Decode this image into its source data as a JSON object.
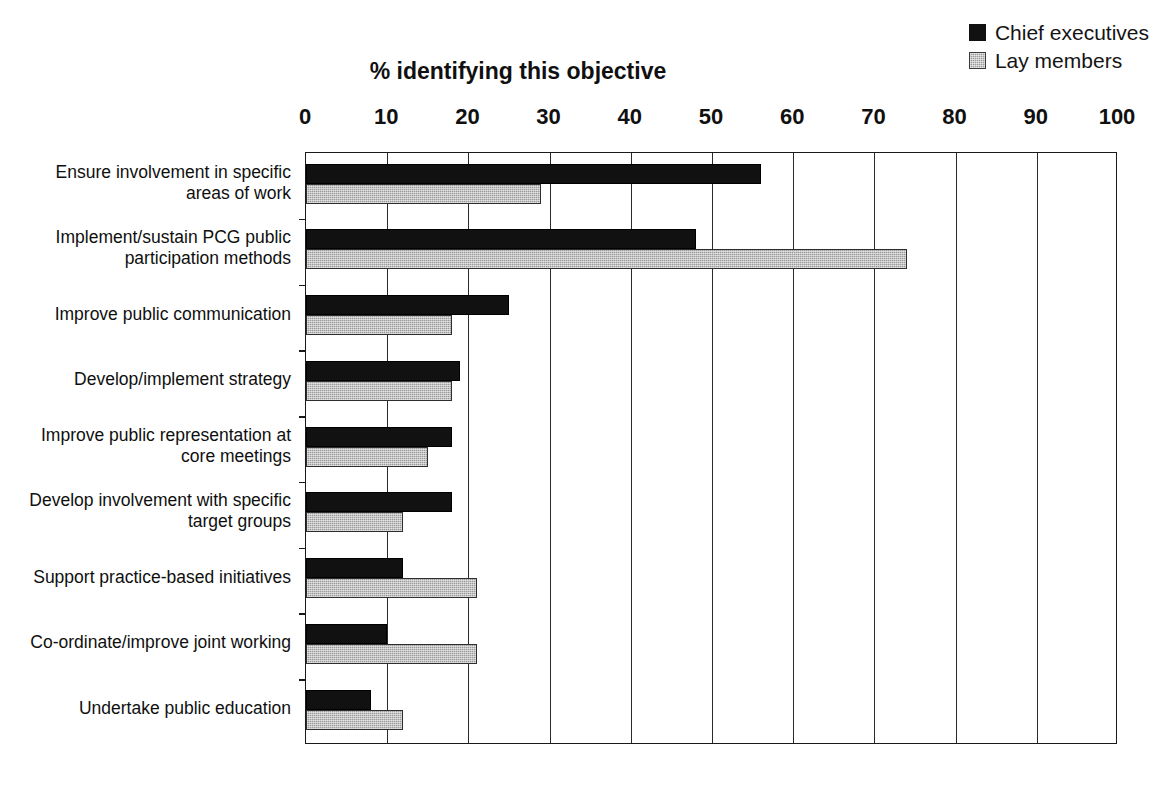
{
  "figure": {
    "cut_off_caption": "",
    "axis_title": "% identifying this objective"
  },
  "legend": {
    "entries": [
      {
        "label": "Chief executives",
        "color": "#111111",
        "swatch": "black"
      },
      {
        "label": "Lay members",
        "color": "#9b9b9b",
        "swatch": "gray"
      }
    ]
  },
  "chart_data": {
    "type": "bar",
    "orientation": "horizontal",
    "title": "",
    "xlabel": "% identifying this objective",
    "ylabel": "",
    "xlim": [
      0,
      100
    ],
    "xticks": [
      0,
      10,
      20,
      30,
      40,
      50,
      60,
      70,
      80,
      90,
      100
    ],
    "xtick_labels": [
      "0",
      "10",
      "20",
      "30",
      "40",
      "50",
      "60",
      "70",
      "80",
      "90",
      "100"
    ],
    "grid": true,
    "grid_axis": "x",
    "legend_position": "top-right",
    "categories": [
      "Ensure involvement in specific areas of work",
      "Implement/sustain PCG public participation methods",
      "Improve public communication",
      "Develop/implement strategy",
      "Improve public representation at core meetings",
      "Develop involvement with specific target groups",
      "Support practice-based initiatives",
      "Co-ordinate/improve joint working",
      "Undertake public education"
    ],
    "category_lines": [
      [
        "Ensure involvement in specific",
        "areas of work"
      ],
      [
        "Implement/sustain PCG public",
        "participation methods"
      ],
      [
        "Improve public communication"
      ],
      [
        "Develop/implement strategy"
      ],
      [
        "Improve public representation at",
        "core meetings"
      ],
      [
        "Develop involvement with specific",
        "target groups"
      ],
      [
        "Support practice-based initiatives"
      ],
      [
        "Co-ordinate/improve joint working"
      ],
      [
        "Undertake public education"
      ]
    ],
    "series": [
      {
        "name": "Chief executives",
        "color": "#111111",
        "values": [
          56,
          48,
          25,
          19,
          18,
          18,
          12,
          10,
          8
        ]
      },
      {
        "name": "Lay members",
        "color": "#9b9b9b",
        "values": [
          29,
          74,
          18,
          18,
          15,
          12,
          21,
          21,
          12
        ]
      }
    ]
  }
}
